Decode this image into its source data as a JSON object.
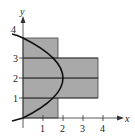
{
  "figure": {
    "axes": {
      "x_label": "x",
      "y_label": "y",
      "x_ticks": [
        "1",
        "2",
        "3",
        "4"
      ],
      "y_ticks": [
        "1",
        "2",
        "3",
        "4"
      ]
    },
    "curve": {
      "equation": "x = 4y - y^2",
      "color": "#111111"
    },
    "rectangles": [
      {
        "y_from": 0,
        "y_to": 1,
        "width": 1.75
      },
      {
        "y_from": 1,
        "y_to": 2,
        "width": 3.75
      },
      {
        "y_from": 2,
        "y_to": 3,
        "width": 3.75
      },
      {
        "y_from": 3,
        "y_to": 4,
        "width": 1.75
      }
    ],
    "colors": {
      "rect_fill": "#a9a9a9",
      "region_fill": "#d4d4d4",
      "outline": "#333333"
    }
  }
}
